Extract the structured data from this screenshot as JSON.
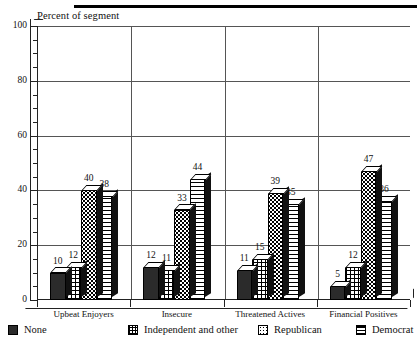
{
  "chart_data": {
    "type": "bar",
    "title": "",
    "ylabel": "Percent of segment",
    "xlabel": "",
    "ylim": [
      0,
      100
    ],
    "yticks": [
      0,
      20,
      40,
      60,
      80,
      100
    ],
    "ytick_labels": [
      "0",
      "20",
      "40",
      "60",
      "80",
      "100"
    ],
    "grid": true,
    "legend_position": "bottom",
    "categories": [
      "Upbeat Enjoyers",
      "Insecure",
      "Threatened Actives",
      "Financial Positives"
    ],
    "series": [
      {
        "name": "None",
        "pattern": "solid-dark",
        "values": [
          10,
          12,
          11,
          5
        ]
      },
      {
        "name": "Independent and other",
        "pattern": "cross-hatch",
        "values": [
          12,
          11,
          15,
          12
        ]
      },
      {
        "name": "Republican",
        "pattern": "dotted",
        "values": [
          40,
          33,
          39,
          47
        ]
      },
      {
        "name": "Democrat",
        "pattern": "horizontal-lines",
        "values": [
          38,
          44,
          35,
          36
        ]
      }
    ]
  },
  "axis": {
    "y_title": "Percent of segment"
  },
  "legend": {
    "items": [
      {
        "label": "None",
        "swatch": "solid-dark-swatch"
      },
      {
        "label": "Independent and other",
        "swatch": "cross-hatch-swatch"
      },
      {
        "label": "Republican",
        "swatch": "dotted-swatch"
      },
      {
        "label": "Democrat",
        "swatch": "horizontal-lines-swatch"
      }
    ]
  },
  "colors": {
    "ink": "#111111",
    "grid": "#555555",
    "axis": "#222222",
    "bar_dark": "#2b2b2b",
    "background": "#ffffff"
  }
}
